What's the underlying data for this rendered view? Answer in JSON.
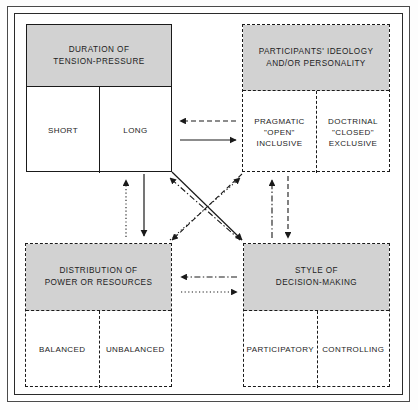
{
  "diagram": {
    "title_hidden": "Four-factor conflict resolution framework",
    "frame": {
      "border_color": "#2b2b2b"
    },
    "header_fill": "#d2d2d2",
    "line_color": "#1a1a1a",
    "boxes": [
      {
        "id": "duration",
        "title": "DURATION OF\nTENSION-PRESSURE",
        "border_style": "solid",
        "cells": [
          "SHORT",
          "LONG"
        ],
        "x": 26,
        "y": 24,
        "w": 146,
        "h": 148,
        "head_h": 62
      },
      {
        "id": "ideology",
        "title": "PARTICIPANTS' IDEOLOGY\nAND/OR PERSONALITY",
        "border_style": "dashed",
        "cells": [
          "PRAGMATIC\n\"OPEN\"\nINCLUSIVE",
          "DOCTRINAL\n\"CLOSED\"\nEXCLUSIVE"
        ],
        "x": 242,
        "y": 24,
        "w": 148,
        "h": 148,
        "head_h": 66
      },
      {
        "id": "distribution",
        "title": "DISTRIBUTION OF\nPOWER OR RESOURCES",
        "border_style": "dotted",
        "cells": [
          "BALANCED",
          "UNBALANCED"
        ],
        "x": 25,
        "y": 243,
        "w": 147,
        "h": 144,
        "head_h": 67
      },
      {
        "id": "style",
        "title": "STYLE OF\nDECISION-MAKING",
        "border_style": "dashdot",
        "cells": [
          "PARTICIPATORY",
          "CONTROLLING"
        ],
        "x": 243,
        "y": 243,
        "w": 147,
        "h": 144,
        "head_h": 67
      }
    ],
    "connectors": [
      {
        "id": "ideology-to-duration",
        "style": "dashed",
        "x1": 236,
        "y1": 121,
        "x2": 180,
        "y2": 121,
        "arrow": "end"
      },
      {
        "id": "duration-to-ideology",
        "style": "solid",
        "x1": 180,
        "y1": 140,
        "x2": 236,
        "y2": 140,
        "arrow": "end"
      },
      {
        "id": "style-to-distribution",
        "style": "dashdot",
        "x1": 237,
        "y1": 277,
        "x2": 181,
        "y2": 277,
        "arrow": "end"
      },
      {
        "id": "distribution-to-style",
        "style": "dotted",
        "x1": 181,
        "y1": 292,
        "x2": 237,
        "y2": 292,
        "arrow": "end"
      },
      {
        "id": "distribution-to-duration",
        "style": "dotted",
        "x1": 126,
        "y1": 237,
        "x2": 126,
        "y2": 180,
        "arrow": "end"
      },
      {
        "id": "duration-to-distribution",
        "style": "solid",
        "x1": 144,
        "y1": 174,
        "x2": 144,
        "y2": 236,
        "arrow": "end"
      },
      {
        "id": "style-to-ideology",
        "style": "dashdot",
        "x1": 272,
        "y1": 238,
        "x2": 272,
        "y2": 180,
        "arrow": "end"
      },
      {
        "id": "ideology-to-style",
        "style": "dashed",
        "x1": 288,
        "y1": 176,
        "x2": 288,
        "y2": 238,
        "arrow": "end"
      },
      {
        "id": "duration-to-style",
        "style": "solid",
        "x1": 172,
        "y1": 172,
        "x2": 242,
        "y2": 240,
        "arrow": "end"
      },
      {
        "id": "style-to-duration",
        "style": "dashdot",
        "x1": 240,
        "y1": 240,
        "x2": 170,
        "y2": 178,
        "arrow": "end"
      },
      {
        "id": "ideology-to-distribution",
        "style": "dashed",
        "x1": 242,
        "y1": 174,
        "x2": 172,
        "y2": 240,
        "arrow": "end"
      },
      {
        "id": "distribution-to-ideology",
        "style": "dotted",
        "x1": 170,
        "y1": 240,
        "x2": 240,
        "y2": 178,
        "arrow": "end"
      }
    ]
  }
}
